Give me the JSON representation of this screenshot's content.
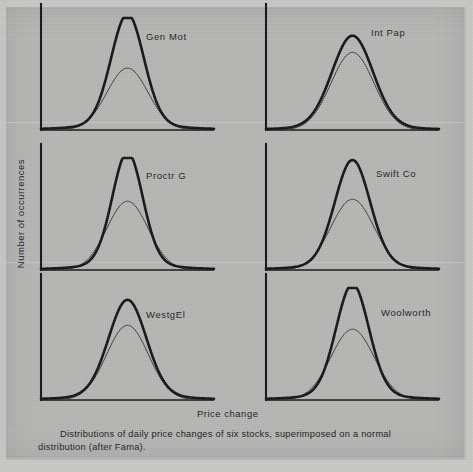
{
  "figure": {
    "caption": "Distributions of daily price changes of six stocks, superimposed on a normal distribution (after Fama).",
    "x_axis_title": "Price change",
    "y_axis_title": "Number of occurrences",
    "background_color": "#b6b6b5",
    "ink_color": "#141414",
    "normal_curve_color": "#3a3a3a"
  },
  "chart_data": {
    "type": "line",
    "title": "Distributions of daily price changes of six stocks, superimposed on a normal distribution (after Fama).",
    "xlabel": "Price change",
    "ylabel": "Number of occurrences",
    "grid": false,
    "legend": "none",
    "axis_ticks": "none",
    "xlim": [
      -4.2,
      4.2
    ],
    "ylim": [
      0,
      1.15
    ],
    "layout": {
      "rows": 3,
      "cols": 2
    },
    "panels": [
      {
        "label": "Gen Mot",
        "row": 0,
        "col": 0,
        "series": [
          {
            "name": "empirical",
            "style": "thick",
            "peak": 1.0,
            "sigma": 0.8,
            "tail_weight": 0.18,
            "kurtosis": "high"
          },
          {
            "name": "normal",
            "style": "thin",
            "peak": 0.63,
            "sigma": 1.0,
            "tail_weight": 0.0,
            "kurtosis": "normal"
          }
        ]
      },
      {
        "label": "Int Pap",
        "row": 0,
        "col": 1,
        "series": [
          {
            "name": "empirical",
            "style": "thick",
            "peak": 0.86,
            "sigma": 1.0,
            "tail_weight": 0.1,
            "kurtosis": "slight"
          },
          {
            "name": "normal",
            "style": "thin",
            "peak": 0.79,
            "sigma": 1.04,
            "tail_weight": 0.0,
            "kurtosis": "normal"
          }
        ]
      },
      {
        "label": "Proctr G",
        "row": 1,
        "col": 0,
        "series": [
          {
            "name": "empirical",
            "style": "thick",
            "peak": 1.0,
            "sigma": 0.74,
            "tail_weight": 0.2,
            "kurtosis": "very high"
          },
          {
            "name": "normal",
            "style": "thin",
            "peak": 0.7,
            "sigma": 1.0,
            "tail_weight": 0.0,
            "kurtosis": "normal"
          }
        ]
      },
      {
        "label": "Swift Co",
        "row": 1,
        "col": 1,
        "series": [
          {
            "name": "empirical",
            "style": "thick",
            "peak": 0.96,
            "sigma": 0.86,
            "tail_weight": 0.16,
            "kurtosis": "high"
          },
          {
            "name": "normal",
            "style": "thin",
            "peak": 0.72,
            "sigma": 1.05,
            "tail_weight": 0.0,
            "kurtosis": "normal"
          }
        ]
      },
      {
        "label": "WestgEl",
        "row": 2,
        "col": 0,
        "series": [
          {
            "name": "empirical",
            "style": "thick",
            "peak": 0.88,
            "sigma": 0.92,
            "tail_weight": 0.14,
            "kurtosis": "moderate"
          },
          {
            "name": "normal",
            "style": "thin",
            "peak": 0.76,
            "sigma": 1.02,
            "tail_weight": 0.0,
            "kurtosis": "normal"
          }
        ]
      },
      {
        "label": "Woolworth",
        "row": 2,
        "col": 1,
        "series": [
          {
            "name": "empirical",
            "style": "thick",
            "peak": 1.0,
            "sigma": 0.8,
            "tail_weight": 0.18,
            "kurtosis": "high"
          },
          {
            "name": "normal",
            "style": "thin",
            "peak": 0.72,
            "sigma": 1.05,
            "tail_weight": 0.0,
            "kurtosis": "normal"
          }
        ]
      }
    ]
  }
}
